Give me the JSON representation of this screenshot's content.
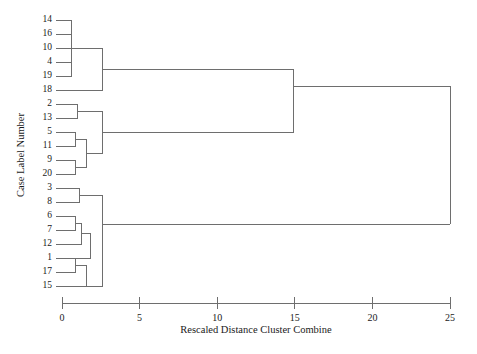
{
  "chart_data": {
    "type": "dendrogram",
    "title": "",
    "xlabel": "Rescaled Distance Cluster Combine",
    "ylabel": "Case Label Number",
    "xlim": [
      0,
      25
    ],
    "xticks": [
      0,
      5,
      10,
      15,
      20,
      25
    ],
    "xtick_labels": [
      "0",
      "5",
      "10",
      "15",
      "20",
      "25"
    ],
    "grid": false,
    "legend": null,
    "orientation": "horizontal",
    "leaf_order": [
      14,
      16,
      10,
      4,
      19,
      18,
      2,
      13,
      5,
      11,
      9,
      20,
      3,
      8,
      6,
      7,
      12,
      1,
      17,
      15
    ],
    "leaf_labels": [
      "14",
      "16",
      "10",
      "4",
      "19",
      "18",
      "2",
      "13",
      "5",
      "11",
      "9",
      "20",
      "3",
      "8",
      "6",
      "7",
      "12",
      "1",
      "17",
      "15"
    ],
    "merges": [
      {
        "id": "m1",
        "children": [
          "14",
          "16"
        ],
        "distance": 0.6
      },
      {
        "id": "m2",
        "children": [
          "m1",
          "10"
        ],
        "distance": 0.6
      },
      {
        "id": "m3",
        "children": [
          "m2",
          "4"
        ],
        "distance": 0.6
      },
      {
        "id": "m4",
        "children": [
          "m3",
          "19"
        ],
        "distance": 0.6
      },
      {
        "id": "m5",
        "children": [
          "m4",
          "18"
        ],
        "distance": 2.6
      },
      {
        "id": "m6",
        "children": [
          "2",
          "13"
        ],
        "distance": 1.0
      },
      {
        "id": "m7",
        "children": [
          "5",
          "11"
        ],
        "distance": 0.9
      },
      {
        "id": "m8",
        "children": [
          "9",
          "20"
        ],
        "distance": 0.9
      },
      {
        "id": "m9",
        "children": [
          "m7",
          "m8"
        ],
        "distance": 1.9
      },
      {
        "id": "m10",
        "children": [
          "m6",
          "m9"
        ],
        "distance": 2.6
      },
      {
        "id": "m11",
        "children": [
          "m10",
          "2-13-branch"
        ],
        "distance": 14.9
      },
      {
        "id": "m12",
        "children": [
          "3",
          "8"
        ],
        "distance": 0.9
      },
      {
        "id": "m13",
        "children": [
          "6",
          "7"
        ],
        "distance": 0.9
      },
      {
        "id": "m14",
        "children": [
          "m13",
          "12"
        ],
        "distance": 1.4
      },
      {
        "id": "m15",
        "children": [
          "1",
          "17"
        ],
        "distance": 0.9
      },
      {
        "id": "m16",
        "children": [
          "m15",
          "15"
        ],
        "distance": 1.9
      },
      {
        "id": "m17",
        "children": [
          "m12",
          "m16"
        ],
        "distance": 2.7
      },
      {
        "id": "m18",
        "children": [
          "m5",
          "m11"
        ],
        "distance": 14.9
      },
      {
        "id": "m19",
        "children": [
          "m17",
          "bottom"
        ],
        "distance": 21.6
      },
      {
        "id": "m20",
        "children": [
          "m18",
          "m19"
        ],
        "distance": 25.0
      }
    ],
    "cluster_summary": [
      {
        "name": "cluster-a",
        "members": [
          "14",
          "16",
          "10",
          "4",
          "19",
          "18"
        ],
        "merge_distance": 2.6
      },
      {
        "name": "cluster-b",
        "members": [
          "2",
          "13",
          "5",
          "11",
          "9",
          "20"
        ],
        "merge_distance": 2.6
      },
      {
        "name": "cluster-c",
        "members": [
          "3",
          "8",
          "6",
          "7",
          "12",
          "1",
          "17",
          "15"
        ],
        "merge_distance": 2.7
      },
      {
        "name": "cluster-ab",
        "members": [
          "cluster-a",
          "cluster-b"
        ],
        "merge_distance": 14.9
      },
      {
        "name": "cluster-root",
        "members": [
          "cluster-ab",
          "cluster-c"
        ],
        "merge_distance": 25.0
      }
    ]
  }
}
